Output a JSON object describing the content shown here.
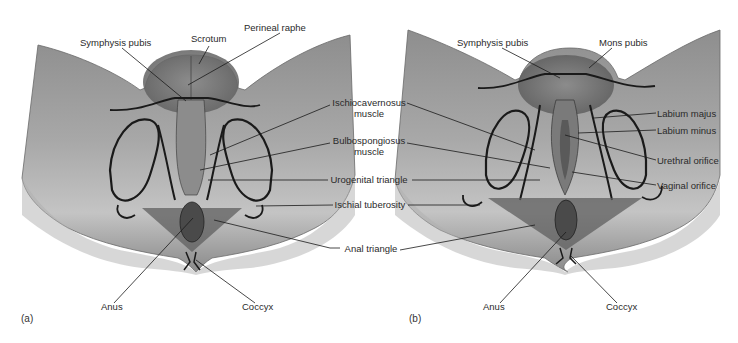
{
  "figure": {
    "panels": [
      {
        "id": "a",
        "letter": "(a)",
        "subject": "male perineum"
      },
      {
        "id": "b",
        "letter": "(b)",
        "subject": "female perineum"
      }
    ],
    "colors": {
      "skin_light": "#c9c9c9",
      "skin_mid": "#9a9a9a",
      "skin_dark": "#6e6e6e",
      "triangle_fill": "#5f5f5f",
      "outline": "#1a1a1a",
      "label_text": "#2a2a2a",
      "background": "#ffffff"
    }
  },
  "labels": {
    "a_symphysis": "Symphysis pubis",
    "a_scrotum": "Scrotum",
    "a_raphe": "Perineal raphe",
    "a_anus": "Anus",
    "a_coccyx": "Coccyx",
    "center_ischio_1": "Ischiocavernosus",
    "center_ischio_2": "muscle",
    "center_bulbo_1": "Bulbospongiosus",
    "center_bulbo_2": "muscle",
    "center_urogenital": "Urogenital triangle",
    "center_ischial": "Ischial tuberosity",
    "center_anal": "Anal triangle",
    "b_symphysis": "Symphysis pubis",
    "b_mons": "Mons pubis",
    "b_labium_majus": "Labium majus",
    "b_labium_minus": "Labium minus",
    "b_urethral": "Urethral orifice",
    "b_vaginal": "Vaginal orifice",
    "b_anus": "Anus",
    "b_coccyx": "Coccyx"
  }
}
